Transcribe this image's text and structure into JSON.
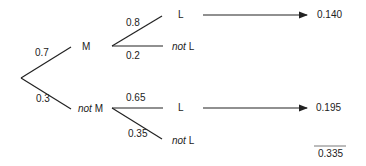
{
  "tree": {
    "root_branches": [
      {
        "prob": "0.7",
        "node": "M"
      },
      {
        "prob": "0.3",
        "node_prefix": "not",
        "node": "M"
      }
    ],
    "M_branches": [
      {
        "prob": "0.8",
        "node": "L",
        "result": "0.140"
      },
      {
        "prob": "0.2",
        "node_prefix": "not",
        "node": "L"
      }
    ],
    "notM_branches": [
      {
        "prob": "0.65",
        "node": "L",
        "result": "0.195"
      },
      {
        "prob": "0.35",
        "node_prefix": "not",
        "node": "L"
      }
    ],
    "total": "0.335"
  },
  "colors": {
    "line": "#222222",
    "text": "#222222"
  }
}
